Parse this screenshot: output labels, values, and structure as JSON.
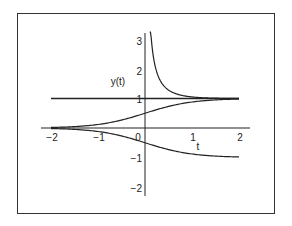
{
  "chart_data": {
    "type": "line",
    "title": "",
    "xlabel": "t",
    "ylabel": "y(t)",
    "xlim": [
      -2,
      2
    ],
    "ylim": [
      -2,
      3
    ],
    "grid": false,
    "x_ticks": [
      "-2",
      "-1",
      "0",
      "1",
      "2"
    ],
    "y_ticks": [
      "3",
      "2",
      "1",
      "-1",
      "-2"
    ],
    "series": [
      {
        "name": "y = 1 (equilibrium)",
        "x": [
          -2,
          2
        ],
        "values": [
          1,
          1
        ]
      },
      {
        "name": "upper solution",
        "x": [
          0.1,
          0.2,
          0.3,
          0.5,
          0.75,
          1.0,
          1.5,
          2.0
        ],
        "values": [
          3.2,
          2.2,
          1.7,
          1.3,
          1.12,
          1.05,
          1.01,
          1.0
        ]
      },
      {
        "name": "middle solution",
        "x": [
          -2,
          -1.5,
          -1,
          -0.5,
          0,
          0.5,
          1,
          1.5,
          2
        ],
        "values": [
          0.02,
          0.05,
          0.12,
          0.27,
          0.5,
          0.73,
          0.88,
          0.95,
          0.98
        ]
      },
      {
        "name": "lower solution",
        "x": [
          -2,
          -1.5,
          -1,
          -0.5,
          0,
          0.5,
          1,
          1.5,
          2
        ],
        "values": [
          -0.02,
          -0.05,
          -0.12,
          -0.27,
          -0.5,
          -0.73,
          -0.88,
          -0.95,
          -0.98
        ]
      }
    ]
  }
}
